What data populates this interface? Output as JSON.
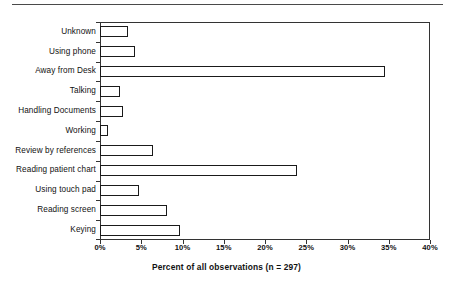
{
  "figure": {
    "divider_name": "page-divider-rule"
  },
  "chart_data": {
    "type": "bar",
    "orientation": "horizontal",
    "title": "",
    "xlabel": "Percent of all observations (n = 297)",
    "ylabel": "",
    "xlim": [
      0,
      40
    ],
    "xticks": [
      0,
      5,
      10,
      15,
      20,
      25,
      30,
      35,
      40
    ],
    "xtick_labels": [
      "0%",
      "5%",
      "10%",
      "15%",
      "20%",
      "25%",
      "30%",
      "35%",
      "40%"
    ],
    "grid": false,
    "legend": null,
    "n": 297,
    "bar_facecolor": "#ffffff",
    "bar_edgecolor": "#1a1a1a",
    "categories": [
      "Unknown",
      "Using phone",
      "Away from Desk",
      "Talking",
      "Handling Documents",
      "Working",
      "Review by references",
      "Reading patient chart",
      "Using touch pad",
      "Reading screen",
      "Keying"
    ],
    "values": [
      3.4,
      4.2,
      34.5,
      2.4,
      2.8,
      1.0,
      6.4,
      23.9,
      4.7,
      8.1,
      9.7
    ]
  }
}
